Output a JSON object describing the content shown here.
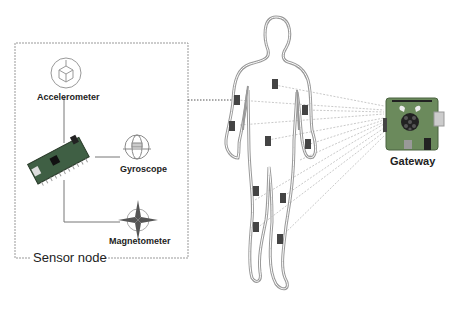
{
  "diagram": {
    "sensor_node": {
      "title": "Sensor node",
      "sensors": [
        {
          "name": "Accelerometer",
          "icon": "accelerometer-icon"
        },
        {
          "name": "Gyroscope",
          "icon": "gyroscope-icon"
        },
        {
          "name": "Magnetometer",
          "icon": "magnetometer-icon"
        }
      ],
      "board_icon": "microcontroller-board-icon"
    },
    "body": {
      "icon": "human-body-outline",
      "sensor_count": 12
    },
    "gateway": {
      "label": "Gateway",
      "icon": "raspberry-pi-board-icon"
    },
    "colors": {
      "outline": "#888888",
      "sensor": "#444444",
      "dashed_link": "#bbbbbb",
      "board_green": "#5a7a4a"
    }
  }
}
